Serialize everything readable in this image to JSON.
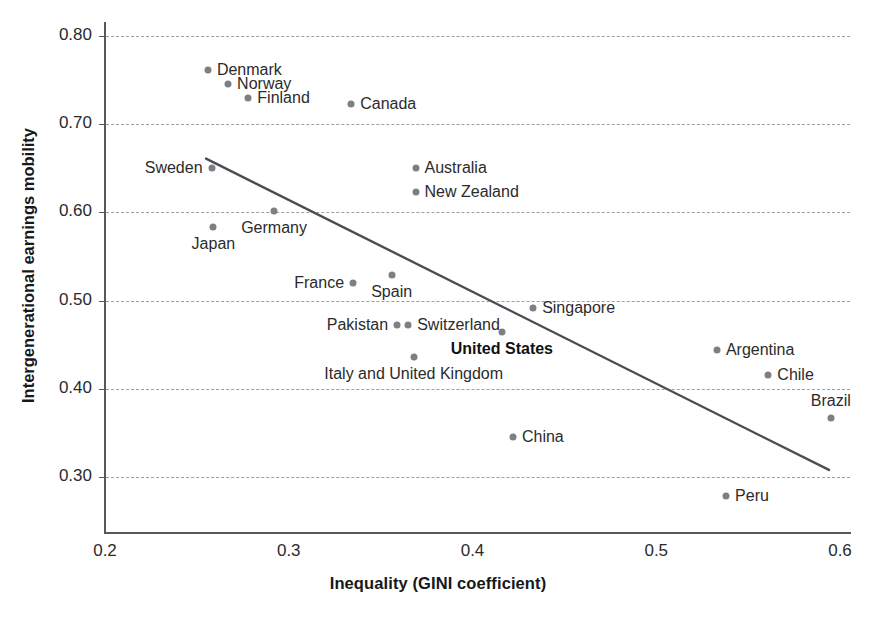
{
  "chart_data": {
    "type": "scatter",
    "title": "",
    "xlabel": "Inequality (GINI coefficient)",
    "ylabel": "Intergenerational earnings mobility",
    "xlim": [
      0.2,
      0.6
    ],
    "ylim": [
      0.255,
      0.835
    ],
    "xticks": [
      "0.2",
      "0.3",
      "0.4",
      "0.5",
      "0.6"
    ],
    "xtick_values": [
      0.2,
      0.3,
      0.4,
      0.5,
      0.6
    ],
    "yticks": [
      "0.30",
      "0.40",
      "0.50",
      "0.60",
      "0.70",
      "0.80"
    ],
    "ytick_values": [
      0.3,
      0.4,
      0.5,
      0.6,
      0.7,
      0.8
    ],
    "grid": "horizontal-dashed",
    "legend": "none",
    "point_color": "#7c8084",
    "trendline_color": "#4a4e52",
    "trendline": {
      "x_start": 0.255,
      "y_start": 0.661,
      "x_end": 0.594,
      "y_end": 0.308
    },
    "points": [
      {
        "label": "Denmark",
        "x": 0.256,
        "y": 0.761,
        "label_pos": "right",
        "bold": false
      },
      {
        "label": "Norway",
        "x": 0.267,
        "y": 0.746,
        "label_pos": "right",
        "bold": false
      },
      {
        "label": "Finland",
        "x": 0.278,
        "y": 0.73,
        "label_pos": "right",
        "bold": false
      },
      {
        "label": "Canada",
        "x": 0.334,
        "y": 0.723,
        "label_pos": "right",
        "bold": false
      },
      {
        "label": "Australia",
        "x": 0.369,
        "y": 0.65,
        "label_pos": "right",
        "bold": false
      },
      {
        "label": "New Zealand",
        "x": 0.369,
        "y": 0.623,
        "label_pos": "right",
        "bold": false
      },
      {
        "label": "Sweden",
        "x": 0.258,
        "y": 0.65,
        "label_pos": "left",
        "bold": false
      },
      {
        "label": "Germany",
        "x": 0.292,
        "y": 0.602,
        "label_pos": "below",
        "bold": false
      },
      {
        "label": "Japan",
        "x": 0.259,
        "y": 0.583,
        "label_pos": "below",
        "bold": false
      },
      {
        "label": "France",
        "x": 0.335,
        "y": 0.52,
        "label_pos": "left",
        "bold": false
      },
      {
        "label": "Spain",
        "x": 0.356,
        "y": 0.529,
        "label_pos": "below",
        "bold": false
      },
      {
        "label": "Singapore",
        "x": 0.433,
        "y": 0.492,
        "label_pos": "right",
        "bold": false
      },
      {
        "label": "Pakistan",
        "x": 0.359,
        "y": 0.472,
        "label_pos": "left",
        "bold": false
      },
      {
        "label": "Switzerland",
        "x": 0.365,
        "y": 0.472,
        "label_pos": "right",
        "bold": false
      },
      {
        "label": "United States",
        "x": 0.416,
        "y": 0.464,
        "label_pos": "below",
        "bold": true
      },
      {
        "label": "Italy and United Kingdom",
        "x": 0.368,
        "y": 0.436,
        "label_pos": "below",
        "bold": false
      },
      {
        "label": "Argentina",
        "x": 0.533,
        "y": 0.444,
        "label_pos": "right",
        "bold": false
      },
      {
        "label": "Chile",
        "x": 0.561,
        "y": 0.416,
        "label_pos": "right",
        "bold": false
      },
      {
        "label": "Brazil",
        "x": 0.595,
        "y": 0.367,
        "label_pos": "above",
        "bold": false
      },
      {
        "label": "China",
        "x": 0.422,
        "y": 0.345,
        "label_pos": "right",
        "bold": false
      },
      {
        "label": "Peru",
        "x": 0.538,
        "y": 0.279,
        "label_pos": "right",
        "bold": false
      }
    ]
  }
}
